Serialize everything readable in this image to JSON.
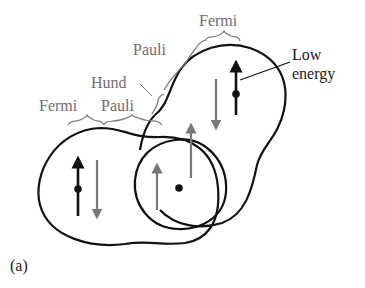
{
  "diagram": {
    "panel_label": "(a)",
    "brace_labels": {
      "fermi_left": "Fermi",
      "pauli_left": "Pauli",
      "hund": "Hund",
      "pauli_upper": "Pauli",
      "fermi_top": "Fermi"
    },
    "callout": {
      "line1": "Low",
      "line2": "energy"
    },
    "colors": {
      "outline": "#111111",
      "gray_arrow": "#777777",
      "label_gray": "#6e6e6e",
      "black_arrow": "#111111"
    }
  }
}
